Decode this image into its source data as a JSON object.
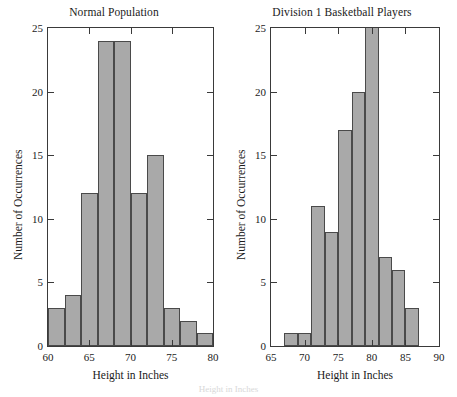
{
  "figure": {
    "caption_fragment": "Height in Inches"
  },
  "chart_data": [
    {
      "type": "bar",
      "title": "Normal Population",
      "xlabel": "Height in Inches",
      "ylabel": "Number of Occurrences",
      "xlim": [
        60,
        80
      ],
      "ylim": [
        0,
        25
      ],
      "xticks": [
        60,
        65,
        70,
        75,
        80
      ],
      "yticks": [
        0,
        5,
        10,
        15,
        20,
        25
      ],
      "grid": false,
      "bin_width": 2,
      "bin_edges": [
        60,
        62,
        64,
        66,
        68,
        70,
        72,
        74,
        76,
        78
      ],
      "categories": [
        "60-62",
        "62-64",
        "64-66",
        "66-68",
        "68-70",
        "70-72",
        "72-74",
        "74-76",
        "76-78",
        "78-80"
      ],
      "values": [
        3,
        4,
        12,
        24,
        24,
        12,
        15,
        3,
        2,
        1
      ],
      "bar_color": "#a9a9a9",
      "bar_edge_color": "#4a4a4a"
    },
    {
      "type": "bar",
      "title": "Division 1 Basketball Players",
      "xlabel": "Height in Inches",
      "ylabel": "Number of Occurrences",
      "xlim": [
        65,
        90
      ],
      "ylim": [
        0,
        25
      ],
      "xticks": [
        65,
        70,
        75,
        80,
        85,
        90
      ],
      "yticks": [
        0,
        5,
        10,
        15,
        20,
        25
      ],
      "grid": false,
      "bin_width": 2,
      "bin_edges": [
        67,
        69,
        71,
        73,
        75,
        77,
        79,
        81,
        83,
        85
      ],
      "categories": [
        "67-69",
        "69-71",
        "71-73",
        "73-75",
        "75-77",
        "77-79",
        "79-81",
        "81-83",
        "83-85",
        "85-87"
      ],
      "values": [
        1,
        1,
        11,
        9,
        17,
        20,
        28,
        7,
        6,
        3
      ],
      "clipped_bars": [
        6
      ],
      "bar_color": "#a9a9a9",
      "bar_edge_color": "#4a4a4a"
    }
  ]
}
